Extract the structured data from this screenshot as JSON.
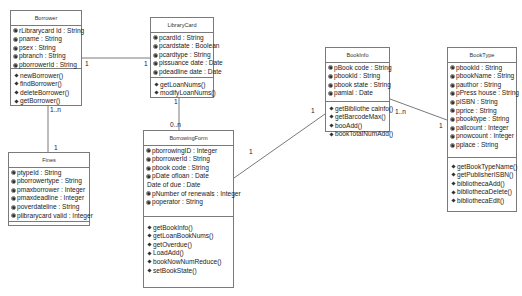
{
  "classes": {
    "borrower": {
      "name": "Borrower",
      "attributes": [
        "rLibrarycard Id : String",
        "pname : String",
        "psex : String",
        "pbranch : String",
        "pborrowerId : String"
      ],
      "operations": [
        "newBorrower()",
        "findBorrower()",
        "deleteBorrower()",
        "getBorrower()"
      ]
    },
    "librarycard": {
      "name": "LibraryCard",
      "attributes": [
        "pcardId : String",
        "pcardstate : Boolean",
        "pcardtype : String",
        "pissuance date : Date",
        "pdeadline date : Date"
      ],
      "operations": [
        "getLoanNums()",
        "modifyLoanNums()"
      ]
    },
    "fines": {
      "name": "Fines",
      "attributes": [
        "ptypeId : String",
        "pborrowertype : String",
        "pmaxborrower : Integer",
        "pmaxdeadline : Integer",
        "poverdateline : String",
        "plibrarycard valid : Integer"
      ],
      "operations": []
    },
    "borrowingform": {
      "name": "BorrowingForm",
      "attributes": [
        "pborrowingID : Integer",
        "pborrowerId : String",
        "pbook code : String",
        "pDate ofloan : Date",
        "Date of due : Date",
        "pNumber of renewals : Integer",
        "poperator : String"
      ],
      "operations": [
        "getBookInfo()",
        "getLoanBookNums()",
        "getOverdue()",
        "LoadAdd()",
        "bookNowNumReduce()",
        "setBookState()"
      ]
    },
    "bookinfo": {
      "name": "BookInfo",
      "attributes": [
        "pBook code : String",
        "pbookId : String",
        "pbook state : String",
        "pamial : Date"
      ],
      "operations": [
        "getBibliothe calnfo()",
        "getBarcodeMax()",
        "booAdd()",
        "bookTotalNumAdd()"
      ]
    },
    "booktype": {
      "name": "BookType",
      "attributes": [
        "pbookId : String",
        "pbookName : String",
        "pauthor : String",
        "pPress house : String",
        "pISBN : String",
        "pprice : String",
        "pbooktype : String",
        "pallcount : Integer",
        "pnowcount : Integer",
        "pplace : String"
      ],
      "operations": [
        "getBookTypeName()",
        "getPublisherISBN()",
        "bibliothecaAdd()",
        "bibliothecaDelete()",
        "bibliothecaEdit()"
      ]
    }
  },
  "associations": [
    {
      "from": "Borrower",
      "to": "LibraryCard",
      "from_mult": "1",
      "to_mult": "1"
    },
    {
      "from": "Borrower",
      "to": "Fines",
      "from_mult": "1..n",
      "to_mult": "1"
    },
    {
      "from": "LibraryCard",
      "to": "BorrowingForm",
      "from_mult": "1",
      "to_mult": "0..n"
    },
    {
      "from": "BorrowingForm",
      "to": "BookInfo",
      "from_mult": "1",
      "to_mult": "1"
    },
    {
      "from": "BookInfo",
      "to": "BookType",
      "from_mult": "1..n",
      "to_mult": "1"
    }
  ],
  "colors": {
    "line": "#7a7a7a",
    "text": "#222222",
    "background": "#ffffff"
  }
}
